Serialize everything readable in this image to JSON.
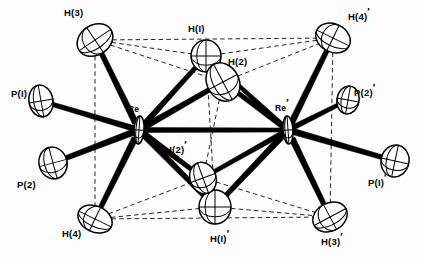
{
  "figure": {
    "kind": "ortep-thermal-ellipsoid-diagram",
    "background_color": "#ffffff",
    "ink_color": "#000000",
    "bond_style": "solid tapered black rods",
    "contact_style": "thin dashed lines",
    "ellipsoid_style": "open outline with principal-axis cross hairs"
  },
  "labels": [
    {
      "id": "H3",
      "text": "H(3)",
      "prime": false,
      "x": 64,
      "y": 8,
      "for": "atom-h3"
    },
    {
      "id": "H1",
      "text": "H(I)",
      "prime": false,
      "x": 188,
      "y": 24,
      "for": "atom-h1"
    },
    {
      "id": "H2",
      "text": "H(2)",
      "prime": false,
      "x": 228,
      "y": 57,
      "for": "atom-h2"
    },
    {
      "id": "H4p",
      "text": "H(4)",
      "prime": true,
      "x": 348,
      "y": 12,
      "for": "atom-h4p"
    },
    {
      "id": "P1",
      "text": "P(I)",
      "prime": false,
      "x": 11,
      "y": 89,
      "for": "atom-p1"
    },
    {
      "id": "P2p",
      "text": "P(2)",
      "prime": true,
      "x": 354,
      "y": 88,
      "for": "atom-p2p"
    },
    {
      "id": "Re",
      "text": "Re",
      "prime": false,
      "x": 128,
      "y": 105,
      "for": "atom-re"
    },
    {
      "id": "Rep",
      "text": "Re",
      "prime": true,
      "x": 275,
      "y": 104,
      "for": "atom-rep"
    },
    {
      "id": "H2p",
      "text": "H(2)",
      "prime": true,
      "x": 165,
      "y": 145,
      "for": "atom-h2p"
    },
    {
      "id": "P2",
      "text": "P(2)",
      "prime": false,
      "x": 17,
      "y": 180,
      "for": "atom-p2"
    },
    {
      "id": "P1p",
      "text": "P(I)",
      "prime": true,
      "x": 368,
      "y": 178,
      "for": "atom-p1p"
    },
    {
      "id": "H4",
      "text": "H(4)",
      "prime": false,
      "x": 62,
      "y": 229,
      "for": "atom-h4"
    },
    {
      "id": "H1p",
      "text": "H(I)",
      "prime": true,
      "x": 210,
      "y": 234,
      "for": "atom-h1p"
    },
    {
      "id": "H3p",
      "text": "H(3)",
      "prime": true,
      "x": 321,
      "y": 237,
      "for": "atom-h3p"
    }
  ],
  "atoms": [
    {
      "id": "atom-re",
      "label": "Re",
      "x": 139,
      "y": 130,
      "rx": 5,
      "ry": 14,
      "rot": 4,
      "kind": "metal"
    },
    {
      "id": "atom-rep",
      "label": "Re'",
      "x": 288,
      "y": 130,
      "rx": 5,
      "ry": 14,
      "rot": -4,
      "kind": "metal"
    },
    {
      "id": "atom-p1",
      "label": "P(1)",
      "x": 41,
      "y": 101,
      "rx": 12,
      "ry": 16,
      "rot": -10,
      "kind": "phosphorus"
    },
    {
      "id": "atom-p2",
      "label": "P(2)",
      "x": 53,
      "y": 163,
      "rx": 14,
      "ry": 16,
      "rot": -15,
      "kind": "phosphorus"
    },
    {
      "id": "atom-p2p",
      "label": "P(2)'",
      "x": 348,
      "y": 100,
      "rx": 11,
      "ry": 14,
      "rot": 10,
      "kind": "phosphorus"
    },
    {
      "id": "atom-p1p",
      "label": "P(1)'",
      "x": 395,
      "y": 161,
      "rx": 14,
      "ry": 16,
      "rot": 12,
      "kind": "phosphorus"
    },
    {
      "id": "atom-h3",
      "label": "H(3)",
      "x": 95,
      "y": 40,
      "rx": 19,
      "ry": 15,
      "rot": -34,
      "kind": "hydride"
    },
    {
      "id": "atom-h1",
      "label": "H(1)",
      "x": 206,
      "y": 56,
      "rx": 15,
      "ry": 16,
      "rot": 0,
      "kind": "hydride"
    },
    {
      "id": "atom-h2",
      "label": "H(2)",
      "x": 223,
      "y": 82,
      "rx": 16,
      "ry": 20,
      "rot": -28,
      "kind": "hydride"
    },
    {
      "id": "atom-h4p",
      "label": "H(4)'",
      "x": 333,
      "y": 38,
      "rx": 18,
      "ry": 14,
      "rot": 26,
      "kind": "hydride"
    },
    {
      "id": "atom-h4",
      "label": "H(4)",
      "x": 95,
      "y": 219,
      "rx": 18,
      "ry": 13,
      "rot": 26,
      "kind": "hydride"
    },
    {
      "id": "atom-h1p",
      "label": "H(1)'",
      "x": 215,
      "y": 207,
      "rx": 16,
      "ry": 17,
      "rot": 0,
      "kind": "hydride"
    },
    {
      "id": "atom-h2p",
      "label": "H(2)'",
      "x": 203,
      "y": 178,
      "rx": 13,
      "ry": 16,
      "rot": -20,
      "kind": "hydride"
    },
    {
      "id": "atom-h3p",
      "label": "H(3)'",
      "x": 330,
      "y": 217,
      "rx": 18,
      "ry": 14,
      "rot": -28,
      "kind": "hydride"
    }
  ],
  "bonds": [
    {
      "from": "atom-re",
      "to": "atom-rep",
      "width": 5.0,
      "name": "bond-re-rep"
    },
    {
      "from": "atom-re",
      "to": "atom-p1",
      "width": 5.5,
      "name": "bond-re-p1"
    },
    {
      "from": "atom-re",
      "to": "atom-p2",
      "width": 6.0,
      "name": "bond-re-p2"
    },
    {
      "from": "atom-re",
      "to": "atom-h3",
      "width": 6.0,
      "name": "bond-re-h3"
    },
    {
      "from": "atom-re",
      "to": "atom-h4",
      "width": 6.0,
      "name": "bond-re-h4"
    },
    {
      "from": "atom-re",
      "to": "atom-h1",
      "width": 5.5,
      "name": "bond-re-h1"
    },
    {
      "from": "atom-re",
      "to": "atom-h2",
      "width": 6.0,
      "name": "bond-re-h2"
    },
    {
      "from": "atom-re",
      "to": "atom-h1p",
      "width": 6.0,
      "name": "bond-re-h1p"
    },
    {
      "from": "atom-re",
      "to": "atom-h2p",
      "width": 5.5,
      "name": "bond-re-h2p"
    },
    {
      "from": "atom-rep",
      "to": "atom-p2p",
      "width": 5.0,
      "name": "bond-rep-p2p"
    },
    {
      "from": "atom-rep",
      "to": "atom-p1p",
      "width": 6.0,
      "name": "bond-rep-p1p"
    },
    {
      "from": "atom-rep",
      "to": "atom-h4p",
      "width": 6.0,
      "name": "bond-rep-h4p"
    },
    {
      "from": "atom-rep",
      "to": "atom-h3p",
      "width": 6.0,
      "name": "bond-rep-h3p"
    },
    {
      "from": "atom-rep",
      "to": "atom-h2",
      "width": 5.5,
      "name": "bond-rep-h2"
    },
    {
      "from": "atom-rep",
      "to": "atom-h1",
      "width": 4.5,
      "name": "bond-rep-h1"
    },
    {
      "from": "atom-rep",
      "to": "atom-h1p",
      "width": 6.0,
      "name": "bond-rep-h1p"
    },
    {
      "from": "atom-rep",
      "to": "atom-h2p",
      "width": 5.0,
      "name": "bond-rep-h2p"
    }
  ],
  "contacts": [
    {
      "from": "atom-h3",
      "to": "atom-h1",
      "name": "contact-h3-h1"
    },
    {
      "from": "atom-h3",
      "to": "atom-h2",
      "name": "contact-h3-h2"
    },
    {
      "from": "atom-h3",
      "to": "atom-h4p",
      "name": "contact-h3-h4p"
    },
    {
      "from": "atom-h1",
      "to": "atom-h4p",
      "name": "contact-h1-h4p"
    },
    {
      "from": "atom-h2",
      "to": "atom-h4p",
      "name": "contact-h2-h4p"
    },
    {
      "from": "atom-h3",
      "to": "atom-h4",
      "name": "contact-h3-h4"
    },
    {
      "from": "atom-h4p",
      "to": "atom-h3p",
      "name": "contact-h4p-h3p"
    },
    {
      "from": "atom-h1",
      "to": "atom-h1p",
      "name": "contact-h1-h1p"
    },
    {
      "from": "atom-h2",
      "to": "atom-h2p",
      "name": "contact-h2-h2p"
    },
    {
      "from": "atom-h4",
      "to": "atom-h1p",
      "name": "contact-h4-h1p"
    },
    {
      "from": "atom-h4",
      "to": "atom-h2p",
      "name": "contact-h4-h2p"
    },
    {
      "from": "atom-h4",
      "to": "atom-h3p",
      "name": "contact-h4-h3p"
    },
    {
      "from": "atom-h1p",
      "to": "atom-h3p",
      "name": "contact-h1p-h3p"
    },
    {
      "from": "atom-h2p",
      "to": "atom-h3p",
      "name": "contact-h2p-h3p"
    }
  ]
}
